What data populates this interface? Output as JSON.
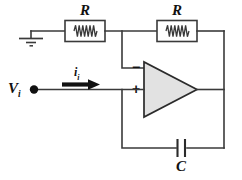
{
  "diagram": {
    "background_color": "#ffffff",
    "wire_color": "#3a3a3a",
    "opamp_fill": "#e2e2e2",
    "label_color": "#111111"
  },
  "labels": {
    "resistor_input": "R",
    "resistor_feedback": "R",
    "capacitor": "C",
    "input_voltage": "V",
    "input_voltage_subscript": "i",
    "input_current": "i",
    "input_current_subscript": "i",
    "inverting_sign": "−",
    "noninverting_sign": "+"
  },
  "components": [
    {
      "name": "ground",
      "type": "ground-symbol",
      "label": ""
    },
    {
      "name": "resistor-input",
      "type": "resistor",
      "label": "R"
    },
    {
      "name": "resistor-feedback",
      "type": "resistor",
      "label": "R"
    },
    {
      "name": "operational-amplifier",
      "type": "opamp-triangle",
      "inverting_input": "−",
      "noninverting_input": "+"
    },
    {
      "name": "capacitor",
      "type": "capacitor",
      "label": "C"
    },
    {
      "name": "input-node",
      "type": "node-dot",
      "label": ""
    },
    {
      "name": "current-arrow",
      "type": "arrow",
      "label": "i_i"
    }
  ]
}
